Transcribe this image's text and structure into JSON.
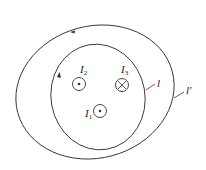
{
  "diagram": {
    "currents": [
      {
        "name": "I",
        "subscript": "1",
        "direction": "out-of-page",
        "symbol": "dot"
      },
      {
        "name": "I",
        "subscript": "2",
        "direction": "out-of-page",
        "symbol": "dot"
      },
      {
        "name": "I",
        "subscript": "3",
        "direction": "into-page",
        "symbol": "cross"
      }
    ],
    "loops": [
      {
        "label": "l",
        "type": "inner",
        "arrow": "counterclockwise"
      },
      {
        "label": "l′",
        "type": "outer",
        "arrow": "counterclockwise"
      }
    ],
    "colors": {
      "stroke": "#333333",
      "background": "#ffffff"
    }
  }
}
